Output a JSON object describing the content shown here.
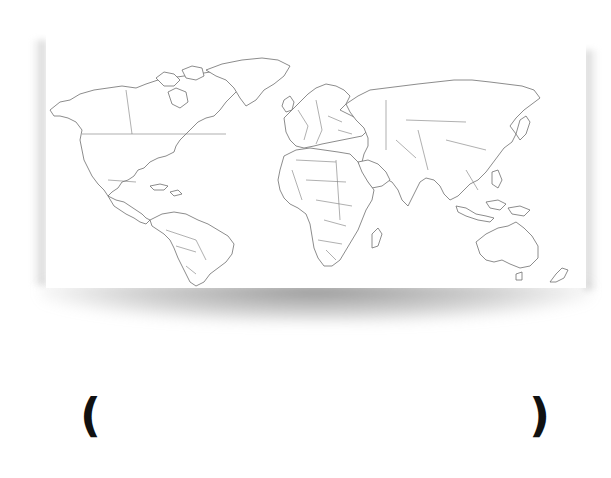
{
  "figure": {
    "type": "world-map-outline",
    "colors": {
      "land_fill": "#ffffff",
      "outline": "#6e6e6e",
      "background": "#ffffff",
      "shadow": "#9a9a9a"
    }
  },
  "answer": {
    "open_paren": "(",
    "close_paren": ")",
    "value": ""
  }
}
